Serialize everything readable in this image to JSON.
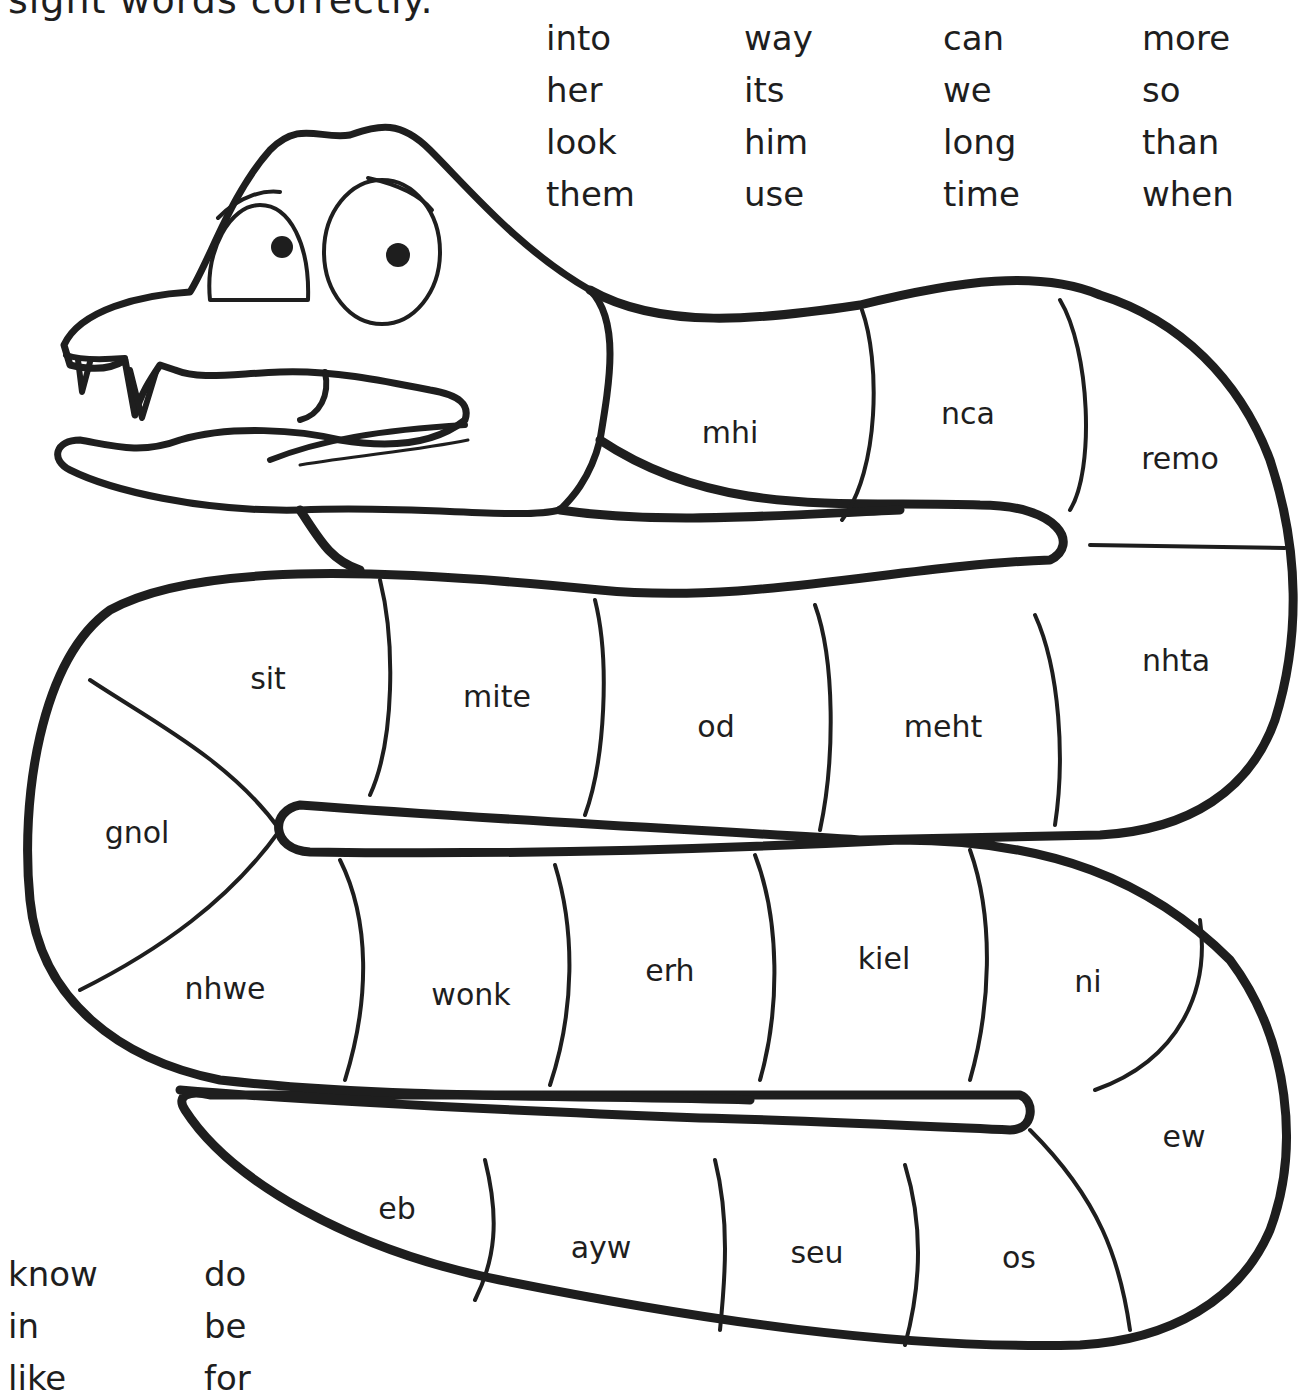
{
  "worksheet": {
    "instruction_fragment": "sight words correctly.",
    "word_bank_top": {
      "columns": [
        [
          "into",
          "her",
          "look",
          "them"
        ],
        [
          "way",
          "its",
          "him",
          "use"
        ],
        [
          "can",
          "we",
          "long",
          "time"
        ],
        [
          "more",
          "so",
          "than",
          "when"
        ]
      ]
    },
    "word_bank_bottom": {
      "columns": [
        [
          "know",
          "in",
          "like"
        ],
        [
          "do",
          "be",
          "for"
        ]
      ]
    },
    "snake_segments": [
      {
        "scrambled": "mhi",
        "x": 730,
        "y": 432
      },
      {
        "scrambled": "nca",
        "x": 968,
        "y": 413
      },
      {
        "scrambled": "remo",
        "x": 1180,
        "y": 458
      },
      {
        "scrambled": "sit",
        "x": 268,
        "y": 678
      },
      {
        "scrambled": "mite",
        "x": 497,
        "y": 696
      },
      {
        "scrambled": "od",
        "x": 716,
        "y": 726
      },
      {
        "scrambled": "meht",
        "x": 943,
        "y": 726
      },
      {
        "scrambled": "nhta",
        "x": 1176,
        "y": 660
      },
      {
        "scrambled": "gnol",
        "x": 137,
        "y": 832
      },
      {
        "scrambled": "nhwe",
        "x": 225,
        "y": 988
      },
      {
        "scrambled": "wonk",
        "x": 471,
        "y": 994
      },
      {
        "scrambled": "erh",
        "x": 670,
        "y": 970
      },
      {
        "scrambled": "kiel",
        "x": 884,
        "y": 958
      },
      {
        "scrambled": "ni",
        "x": 1088,
        "y": 981
      },
      {
        "scrambled": "ew",
        "x": 1184,
        "y": 1136
      },
      {
        "scrambled": "eb",
        "x": 397,
        "y": 1208
      },
      {
        "scrambled": "ayw",
        "x": 601,
        "y": 1247
      },
      {
        "scrambled": "seu",
        "x": 817,
        "y": 1252
      },
      {
        "scrambled": "os",
        "x": 1019,
        "y": 1257
      }
    ],
    "colors": {
      "ink": "#1e1e1e",
      "paper": "#ffffff"
    }
  }
}
